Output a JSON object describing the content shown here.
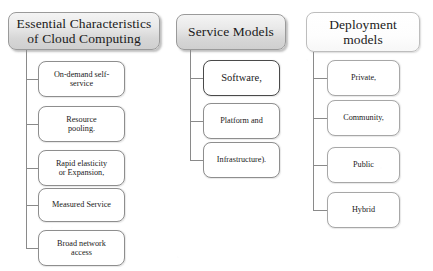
{
  "diagram": {
    "type": "hierarchy-tree",
    "title_text": "Cloud computing characteristics, service models and deployment models",
    "columns": [
      {
        "id": "essential-characteristics",
        "header": "Essential Characteristics\nof Cloud Computing",
        "header_style": "gradient-gray",
        "children": [
          {
            "label": "On-demand self-\nservice"
          },
          {
            "label": "Resource\npooling."
          },
          {
            "label": "Rapid elasticity\nor Expansion,"
          },
          {
            "label": "Measured Service"
          },
          {
            "label": "Broad network\naccess"
          }
        ]
      },
      {
        "id": "service-models",
        "header": "Service Models",
        "header_style": "gradient-gray",
        "children": [
          {
            "label": "Software,"
          },
          {
            "label": "Platform and"
          },
          {
            "label": "Infrastructure)."
          }
        ]
      },
      {
        "id": "deployment-models",
        "header": "Deployment\nmodels",
        "header_style": "light",
        "children": [
          {
            "label": "Private,"
          },
          {
            "label": "Community,"
          },
          {
            "label": "Public"
          },
          {
            "label": "Hybrid"
          }
        ]
      }
    ]
  },
  "colors": {
    "box_border": "#8e8e8e",
    "box_fill": "#ffffff",
    "header_border": "#9a9a9a",
    "connector": "#8a8a8a",
    "text": "#1a1a1a",
    "background": "#ffffff"
  }
}
